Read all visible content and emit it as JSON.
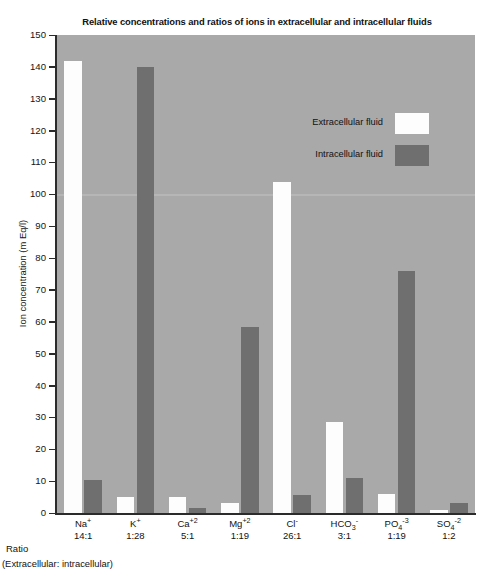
{
  "chart_data": {
    "type": "bar",
    "title": "Relative concentrations and ratios of ions in extracellular and intracellular fluids",
    "xlabel": "",
    "ylabel": "Ion concentration (m Eq/l)",
    "ylim": [
      0,
      150
    ],
    "ytick_step": 10,
    "yticks": [
      150,
      140,
      130,
      120,
      110,
      100,
      90,
      80,
      70,
      60,
      50,
      40,
      30,
      20,
      10,
      0
    ],
    "grid": false,
    "legend_position": "upper-center-right",
    "plot_background": "#a9a9a9",
    "categories": [
      "Na+",
      "K+",
      "Ca+2",
      "Mg+2",
      "Cl-",
      "HCO3-",
      "PO4-3",
      "SO4-2"
    ],
    "category_labels": [
      {
        "base": "Na",
        "charge": "+",
        "charge_pos": "sup"
      },
      {
        "base": "K",
        "charge": "+",
        "charge_pos": "sup"
      },
      {
        "base": "Ca",
        "charge": "+2",
        "charge_pos": "sup"
      },
      {
        "base": "Mg",
        "charge": "+2",
        "charge_pos": "sup"
      },
      {
        "base": "Cl",
        "charge": "-",
        "charge_pos": "sup"
      },
      {
        "base": "HCO",
        "sub": "3",
        "charge": "-",
        "charge_pos": "sup"
      },
      {
        "base": "PO",
        "sub": "4",
        "charge": "-3",
        "charge_pos": "sup"
      },
      {
        "base": "SO",
        "sub": "4",
        "charge": "-2",
        "charge_pos": "sup"
      }
    ],
    "ratios": [
      "14:1",
      "1:28",
      "5:1",
      "1:19",
      "26:1",
      "3:1",
      "1:19",
      "1:2"
    ],
    "series": [
      {
        "name": "Extracellular fluid",
        "color": "#fdfdfd",
        "values": [
          142,
          5,
          5,
          3,
          104,
          28.5,
          6,
          1
        ]
      },
      {
        "name": "Intracellular fluid",
        "color": "#6f6f6f",
        "values": [
          10.5,
          140,
          1.5,
          58.5,
          5.5,
          11,
          76,
          3
        ]
      }
    ]
  },
  "axis": {
    "y_title": "Ion concentration (m Eq/l)"
  },
  "ratio_row": {
    "label": "Ratio",
    "sublabel": "(Extracellular: intracellular)"
  },
  "legend": {
    "items": [
      {
        "label": "Extracellular fluid",
        "swatch": "extracellular"
      },
      {
        "label": "Intracellular fluid",
        "swatch": "intracellular"
      }
    ]
  }
}
